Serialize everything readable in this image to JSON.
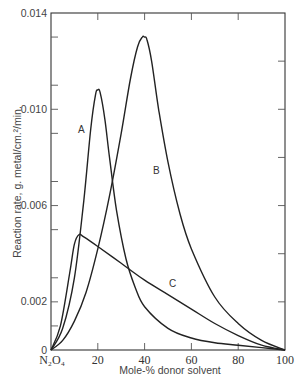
{
  "chart_data": {
    "type": "line",
    "title": "",
    "xlabel": "Mole-% donor solvent",
    "ylabel": "Reaction rate, g. metal/cm.²/min.",
    "xlim": [
      0,
      100
    ],
    "ylim": [
      0,
      0.014
    ],
    "x_ticks": [
      0,
      20,
      40,
      60,
      80,
      100
    ],
    "x_tick_labels": [
      "N₂O₄",
      "20",
      "40",
      "60",
      "80",
      "100"
    ],
    "y_ticks": [
      0,
      0.002,
      0.006,
      0.01,
      0.014
    ],
    "y_tick_labels": [
      "0",
      "0.002",
      "0.006",
      "0.010",
      "0.014"
    ],
    "grid": false,
    "legend": "none (curves labeled inline A, B, C)",
    "series": [
      {
        "name": "A",
        "x": [
          0,
          5,
          10,
          14,
          17,
          19,
          20,
          21,
          23,
          25,
          28,
          32,
          36,
          40,
          50,
          60,
          70,
          80,
          90,
          100
        ],
        "y": [
          0,
          0.0009,
          0.003,
          0.0062,
          0.0092,
          0.0106,
          0.0108,
          0.0107,
          0.0096,
          0.008,
          0.0058,
          0.0038,
          0.0026,
          0.0018,
          0.0009,
          0.0005,
          0.0003,
          0.0002,
          0.0001,
          0
        ]
      },
      {
        "name": "B",
        "x": [
          0,
          5,
          10,
          15,
          20,
          25,
          30,
          34,
          37,
          39,
          40,
          41,
          43,
          46,
          50,
          55,
          60,
          70,
          80,
          90,
          100
        ],
        "y": [
          0,
          0.0004,
          0.0012,
          0.0024,
          0.0042,
          0.0064,
          0.009,
          0.0113,
          0.0126,
          0.013,
          0.013,
          0.0129,
          0.012,
          0.01,
          0.0078,
          0.0057,
          0.0042,
          0.0022,
          0.0011,
          0.0004,
          0
        ]
      },
      {
        "name": "C",
        "x": [
          0,
          4,
          8,
          10,
          12,
          14,
          20,
          30,
          40,
          50,
          60,
          70,
          80,
          90,
          100
        ],
        "y": [
          0,
          0.001,
          0.0032,
          0.0044,
          0.0048,
          0.0047,
          0.0043,
          0.0036,
          0.0029,
          0.0023,
          0.0017,
          0.0011,
          0.0006,
          0.0002,
          0
        ]
      }
    ],
    "annotations": [
      {
        "text": "A",
        "x": 13,
        "y": 0.009
      },
      {
        "text": "B",
        "x": 45,
        "y": 0.0073
      },
      {
        "text": "C",
        "x": 52,
        "y": 0.0026
      }
    ]
  },
  "labels": {
    "y_axis_title": "Reaction rate, g. metal/cm.²/min.",
    "x_axis_title": "Mole-% donor solvent",
    "x_origin_label": "N₂O₄"
  }
}
